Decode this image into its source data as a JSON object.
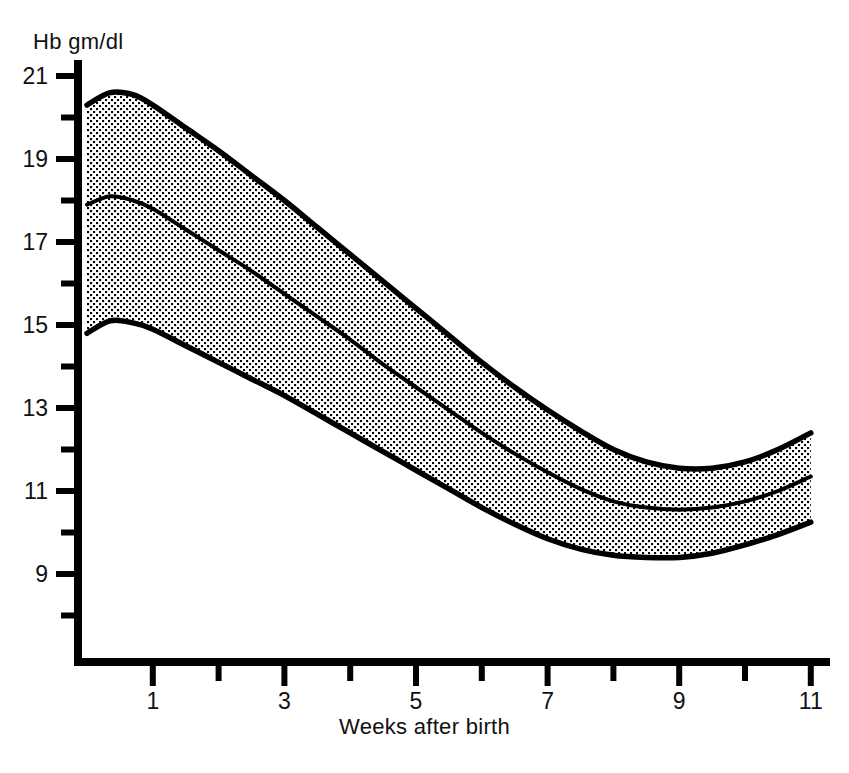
{
  "chart_data": {
    "type": "area",
    "title": "",
    "subtitle": "",
    "xlabel": "Weeks after birth",
    "ylabel": "Hb gm/dl",
    "xlim": [
      0,
      11.6
    ],
    "ylim": [
      7.0,
      21.5
    ],
    "grid": false,
    "legend": null,
    "x_ticks_major": [
      1,
      3,
      5,
      7,
      9,
      11
    ],
    "x_ticks_minor": [
      2,
      4,
      6,
      8,
      10
    ],
    "x_tick_labels": [
      "1",
      "3",
      "5",
      "7",
      "9",
      "11"
    ],
    "y_ticks_major": [
      9,
      11,
      13,
      15,
      17,
      19,
      21
    ],
    "y_ticks_minor": [
      8,
      10,
      12,
      14,
      16,
      18,
      20
    ],
    "y_tick_labels": [
      "9",
      "11",
      "13",
      "15",
      "17",
      "19",
      "21"
    ],
    "x": [
      0,
      0.35,
      0.7,
      1,
      1.5,
      2,
      2.5,
      3,
      3.5,
      4,
      4.5,
      5,
      5.5,
      6,
      6.5,
      7,
      7.5,
      8,
      8.5,
      9,
      9.5,
      10,
      10.5,
      11
    ],
    "series": [
      {
        "name": "upper limit",
        "values": [
          20.3,
          20.6,
          20.55,
          20.3,
          19.75,
          19.2,
          18.6,
          18.0,
          17.35,
          16.7,
          16.05,
          15.4,
          14.75,
          14.1,
          13.5,
          12.95,
          12.45,
          12.0,
          11.7,
          11.55,
          11.55,
          11.7,
          12.0,
          12.4
        ]
      },
      {
        "name": "mean",
        "values": [
          17.9,
          18.1,
          18.0,
          17.8,
          17.3,
          16.8,
          16.3,
          15.75,
          15.2,
          14.65,
          14.05,
          13.5,
          12.95,
          12.4,
          11.9,
          11.45,
          11.05,
          10.75,
          10.6,
          10.55,
          10.6,
          10.75,
          11.0,
          11.35
        ]
      },
      {
        "name": "lower limit",
        "values": [
          14.8,
          15.1,
          15.05,
          14.9,
          14.5,
          14.1,
          13.7,
          13.3,
          12.85,
          12.4,
          11.95,
          11.5,
          11.05,
          10.6,
          10.2,
          9.85,
          9.6,
          9.45,
          9.4,
          9.4,
          9.5,
          9.7,
          9.95,
          10.25
        ]
      }
    ],
    "band": {
      "fill_style": "stipple-dot",
      "fill_color": "#000000",
      "background": "#ffffff",
      "outline_color": "#000000"
    },
    "axis_color": "#000000"
  },
  "axes": {
    "y_title": "Hb gm/dl",
    "x_title": "Weeks after birth"
  }
}
